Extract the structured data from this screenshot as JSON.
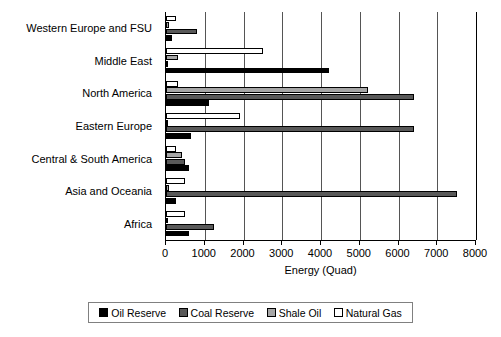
{
  "chart_data": {
    "type": "bar",
    "orientation": "horizontal",
    "title": "",
    "xlabel": "Energy (Quad)",
    "ylabel": "",
    "xlim": [
      0,
      8000
    ],
    "xticks": [
      0,
      1000,
      2000,
      3000,
      4000,
      5000,
      6000,
      7000,
      8000
    ],
    "xtick_labels": [
      "0",
      "1000",
      "2000",
      "3000",
      "4000",
      "5000",
      "6000",
      "7000",
      "8000"
    ],
    "grid": "vertical",
    "legend_position": "bottom",
    "categories": [
      "Western Europe and FSU",
      "Middle East",
      "North America",
      "Eastern Europe",
      "Central & South America",
      "Asia and Oceania",
      "Africa"
    ],
    "series": [
      {
        "name": "Oil Reserve",
        "color": "#000000",
        "values": [
          150,
          4200,
          1100,
          650,
          600,
          250,
          600
        ]
      },
      {
        "name": "Coal Reserve",
        "color": "#595959",
        "values": [
          800,
          0,
          6400,
          6400,
          500,
          7500,
          1250
        ]
      },
      {
        "name": "Shale Oil",
        "color": "#a6a6a6",
        "values": [
          80,
          300,
          5200,
          0,
          400,
          80,
          0
        ]
      },
      {
        "name": "Natural Gas",
        "color": "#ffffff",
        "values": [
          250,
          2500,
          300,
          1900,
          250,
          500,
          500
        ]
      }
    ]
  },
  "legend": {
    "items": [
      {
        "label": "Oil Reserve"
      },
      {
        "label": "Coal Reserve"
      },
      {
        "label": "Shale Oil"
      },
      {
        "label": "Natural Gas"
      }
    ]
  },
  "colors": {
    "oil_reserve": "#000000",
    "coal_reserve": "#595959",
    "shale_oil": "#a6a6a6",
    "natural_gas": "#ffffff",
    "axis": "#000000",
    "gridline": "#555555",
    "background": "#ffffff"
  }
}
